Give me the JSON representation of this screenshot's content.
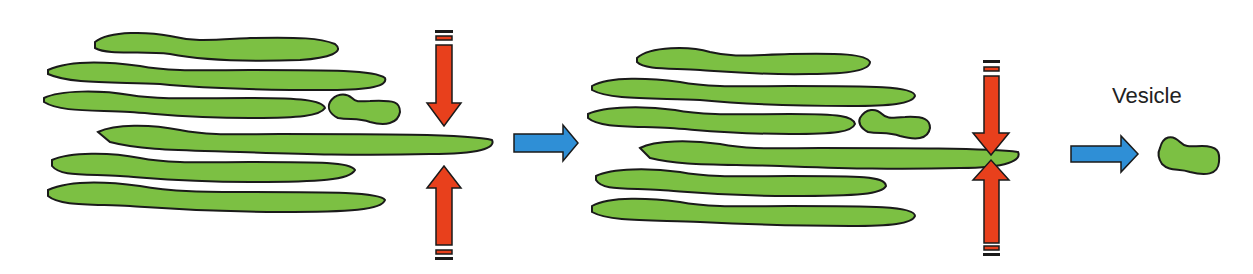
{
  "diagram": {
    "labels": {
      "vesicle": "Vesicle"
    },
    "colors": {
      "membrane_fill": "#7cc043",
      "outline": "#1a1a1a",
      "pinch_arrow": "#e8401c",
      "flow_arrow": "#2f8fd6",
      "background": "#ffffff"
    },
    "stages": [
      {
        "name": "stage-1",
        "description": "Stacked membranes with compressive force arrows"
      },
      {
        "name": "stage-2",
        "description": "Membrane pinched at constriction point"
      },
      {
        "name": "stage-3",
        "description": "Released vesicle"
      }
    ]
  }
}
